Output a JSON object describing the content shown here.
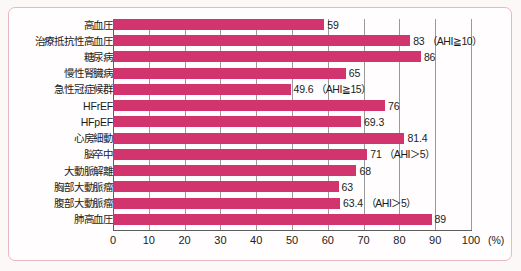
{
  "chart_data": {
    "type": "bar",
    "orientation": "horizontal",
    "title": "",
    "xlabel": "(%)",
    "ylabel": "",
    "xlim": [
      0,
      100
    ],
    "xticks": [
      0,
      10,
      20,
      30,
      40,
      50,
      60,
      70,
      80,
      90,
      100
    ],
    "xtick_labels": [
      "0",
      "10",
      "20",
      "30",
      "40",
      "50",
      "60",
      "70",
      "80",
      "90",
      "100"
    ],
    "grid": true,
    "legend": "none",
    "bar_color": "#d2356e",
    "categories": [
      "高血圧",
      "治療抵抗性高血圧",
      "糖尿病",
      "慢性腎臓病",
      "急性冠症候群",
      "HFrEF",
      "HFpEF",
      "心房細動",
      "脳卒中",
      "大動脈解離",
      "胸部大動脈瘤",
      "腹部大動脈瘤",
      "肺高血圧"
    ],
    "values": [
      59,
      83,
      86,
      65,
      49.6,
      76,
      69.3,
      81.4,
      71,
      68,
      63,
      63.4,
      89
    ],
    "value_labels": [
      "59",
      "83",
      "86",
      "65",
      "49.6",
      "76",
      "69.3",
      "81.4",
      "71",
      "68",
      "63",
      "63.4",
      "89"
    ],
    "annotations": [
      "",
      "（AHI≧10）",
      "",
      "",
      "（AHI≧15）",
      "",
      "",
      "",
      "（AHI＞5）",
      "",
      "",
      "（AHI＞5）",
      ""
    ]
  }
}
